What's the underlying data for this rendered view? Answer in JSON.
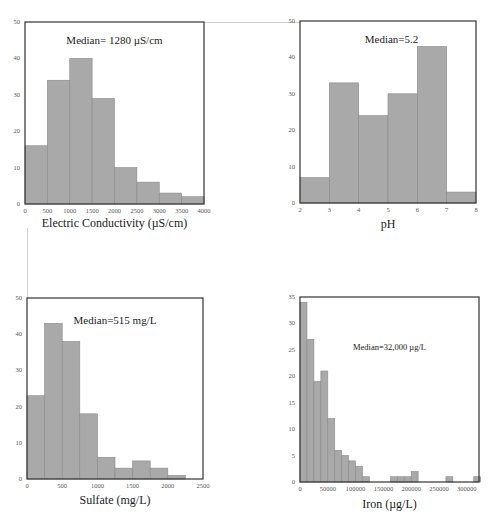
{
  "style": {
    "bar_fill": "#a9a9a9",
    "bar_edge": "#8a8a8a",
    "frame": "#333333"
  },
  "chart_data": [
    {
      "type": "bar",
      "subtype": "histogram",
      "title": "",
      "annotation": "Median= 1280 µS/cm",
      "xlabel": "Electric Conductivity (µS/cm)",
      "ylabel": "",
      "bin_edges": [
        0,
        500,
        1000,
        1500,
        2000,
        2500,
        3000,
        3500,
        4000
      ],
      "values": [
        16,
        34,
        40,
        29,
        10,
        6,
        3,
        2
      ],
      "xlim": [
        0,
        4000
      ],
      "ylim": [
        0,
        50
      ],
      "xticks": [
        0,
        500,
        1000,
        1500,
        2000,
        2500,
        3000,
        3500,
        4000
      ],
      "yticks": [
        0,
        10,
        20,
        30,
        40,
        50
      ],
      "grid": false,
      "legend": null
    },
    {
      "type": "bar",
      "subtype": "histogram",
      "title": "",
      "annotation": "Median=5.2",
      "xlabel": "pH",
      "ylabel": "",
      "bin_edges": [
        2,
        3,
        4,
        5,
        6,
        7,
        8
      ],
      "values": [
        7,
        33,
        24,
        30,
        43,
        3
      ],
      "xlim": [
        2,
        8
      ],
      "ylim": [
        0,
        50
      ],
      "xticks": [
        2,
        3,
        4,
        5,
        6,
        7,
        8
      ],
      "yticks": [
        0,
        10,
        20,
        30,
        40,
        50
      ],
      "grid": false,
      "legend": null
    },
    {
      "type": "bar",
      "subtype": "histogram",
      "title": "",
      "annotation": "Median=515 mg/L",
      "xlabel": "Sulfate (mg/L)",
      "ylabel": "",
      "bin_edges": [
        0,
        250,
        500,
        750,
        1000,
        1250,
        1500,
        1750,
        2000,
        2250
      ],
      "values": [
        23,
        43,
        38,
        18,
        6,
        3,
        5,
        3,
        1
      ],
      "xlim": [
        0,
        2500
      ],
      "ylim": [
        0,
        50
      ],
      "xticks": [
        0,
        500,
        1000,
        1500,
        2000,
        2500
      ],
      "yticks": [
        0,
        10,
        20,
        30,
        40,
        50
      ],
      "grid": false,
      "legend": null
    },
    {
      "type": "bar",
      "subtype": "histogram",
      "title": "",
      "annotation": "Median=32,000 µg/L",
      "xlabel": "Iron (µg/L)",
      "ylabel": "",
      "bin_width": 12500,
      "bin_edges": [
        0,
        12500,
        25000,
        37500,
        50000,
        62500,
        75000,
        87500,
        100000,
        112500,
        125000,
        137500,
        150000,
        162500,
        175000,
        187500,
        200000,
        212500,
        225000,
        237500,
        250000,
        262500,
        275000,
        287500,
        300000,
        312500,
        325000
      ],
      "values": [
        34,
        27,
        19,
        21,
        12,
        6,
        5,
        4,
        3,
        1,
        0,
        0,
        0,
        1,
        1,
        1,
        2,
        0,
        0,
        0,
        0,
        1,
        0,
        0,
        0,
        1
      ],
      "xlim": [
        0,
        322000
      ],
      "ylim": [
        0,
        35
      ],
      "xticks": [
        0,
        50000,
        100000,
        150000,
        200000,
        250000,
        300000
      ],
      "yticks": [
        0,
        5,
        10,
        15,
        20,
        25,
        30,
        35
      ],
      "grid": false,
      "legend": null
    }
  ],
  "panels": [
    {
      "id": "ec",
      "left": 25,
      "top": 22,
      "width": 179,
      "height": 182,
      "median_x": 0.5,
      "median_y": 0.1,
      "median_size": 11,
      "xlabel_dy": 20
    },
    {
      "id": "ph",
      "left": 300,
      "top": 21,
      "width": 176,
      "height": 182,
      "median_x": 0.52,
      "median_y": 0.1,
      "median_size": 11,
      "xlabel_dy": 22
    },
    {
      "id": "sulfate",
      "left": 27,
      "top": 298,
      "width": 176,
      "height": 181,
      "median_x": 0.5,
      "median_y": 0.12,
      "median_size": 11,
      "xlabel_dy": 22
    },
    {
      "id": "iron",
      "left": 300,
      "top": 297,
      "width": 179,
      "height": 185,
      "median_x": 0.5,
      "median_y": 0.27,
      "median_size": 8.5,
      "xlabel_dy": 23
    }
  ]
}
